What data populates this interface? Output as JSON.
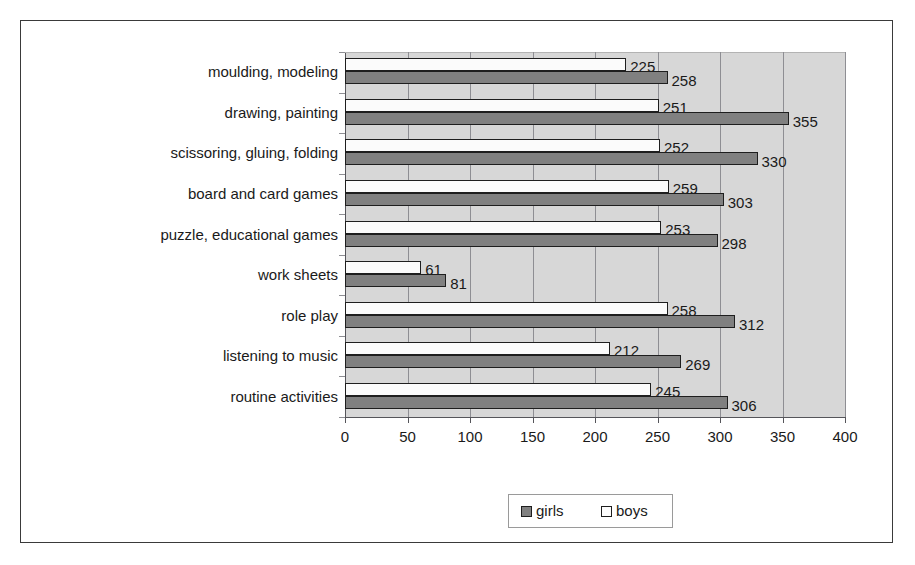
{
  "chart_data": {
    "type": "bar",
    "orientation": "horizontal",
    "title": "",
    "xlabel": "",
    "ylabel": "",
    "xlim": [
      0,
      400
    ],
    "xticks": [
      0,
      50,
      100,
      150,
      200,
      250,
      300,
      350,
      400
    ],
    "xtick_labels": [
      "0",
      "50",
      "100",
      "150",
      "200",
      "250",
      "300",
      "350",
      "400"
    ],
    "grid": true,
    "grid_axis": "x",
    "legend_position": "bottom-center",
    "categories": [
      "moulding, modeling",
      "drawing, painting",
      "scissoring, gluing, folding",
      "board and card games",
      "puzzle, educational games",
      "work sheets",
      "role play",
      "listening to music",
      "routine activities"
    ],
    "series": [
      {
        "name": "girls",
        "color": "#808080",
        "values": [
          258,
          355,
          330,
          303,
          298,
          81,
          312,
          269,
          306
        ]
      },
      {
        "name": "boys",
        "color": "#fbfbfb",
        "values": [
          225,
          251,
          252,
          259,
          253,
          61,
          258,
          212,
          245
        ]
      }
    ],
    "colors": {
      "plot_background": "#d7d7d7",
      "gridline": "#8e8e93",
      "axis": "#55555a",
      "text": "#1a1a1a",
      "frame": "#3a3a3a"
    }
  },
  "legend": {
    "entries": [
      {
        "label": "girls",
        "swatch": "girls-swatch"
      },
      {
        "label": "boys",
        "swatch": "boys-swatch"
      }
    ]
  }
}
